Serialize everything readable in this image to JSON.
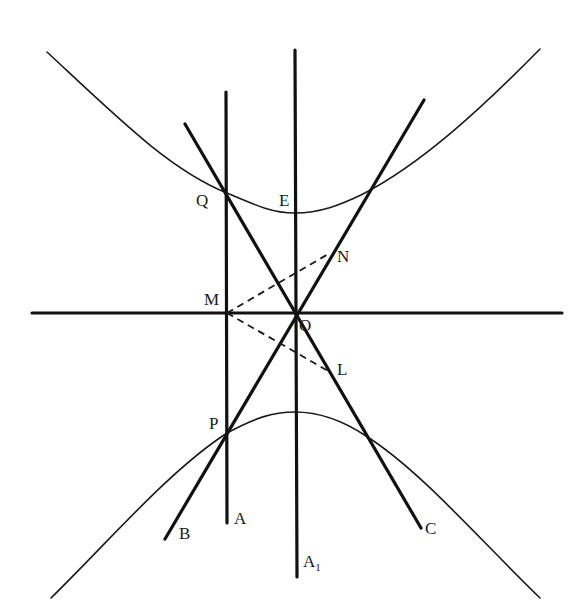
{
  "diagram": {
    "type": "hyperbola-construction",
    "colors": {
      "ink": "#111111",
      "background": "#ffffff"
    },
    "labels": {
      "Q": "Q",
      "E": "E",
      "N": "N",
      "M": "M",
      "O": "O",
      "L": "L",
      "P": "P",
      "A": "A",
      "B": "B",
      "C": "C",
      "A1_main": "A",
      "A1_sub": "1"
    },
    "points": {
      "O": [
        295,
        313
      ],
      "M": [
        227,
        313
      ],
      "Q": [
        227,
        193
      ],
      "P": [
        227,
        433
      ],
      "E": [
        295,
        213
      ],
      "N": [
        330,
        253
      ],
      "L": [
        330,
        372
      ]
    },
    "lines": [
      {
        "name": "horizontal-axis",
        "from": [
          32,
          313
        ],
        "to": [
          562,
          313
        ]
      },
      {
        "name": "vertical-axis-A1",
        "from": [
          295,
          50
        ],
        "to": [
          297,
          577
        ]
      },
      {
        "name": "vertical-line-A",
        "from": [
          226,
          102
        ],
        "to": [
          227,
          523
        ]
      },
      {
        "name": "line-QC",
        "from": [
          185,
          134
        ],
        "to": [
          421,
          528
        ]
      },
      {
        "name": "line-BN",
        "from": [
          424,
          100
        ],
        "to": [
          165,
          539
        ]
      }
    ],
    "dashed": [
      {
        "name": "dashed-MN",
        "from": [
          227,
          313
        ],
        "to": [
          330,
          253
        ]
      },
      {
        "name": "dashed-ML",
        "from": [
          227,
          313
        ],
        "to": [
          330,
          372
        ]
      }
    ],
    "curves": [
      {
        "name": "upper-hyperbola-branch",
        "vertex": [
          295,
          213
        ],
        "ends": [
          [
            47,
            52
          ],
          [
            540,
            49
          ]
        ]
      },
      {
        "name": "lower-hyperbola-branch",
        "vertex": [
          295,
          412
        ],
        "ends": [
          [
            51,
            598
          ],
          [
            540,
            598
          ]
        ]
      }
    ]
  }
}
